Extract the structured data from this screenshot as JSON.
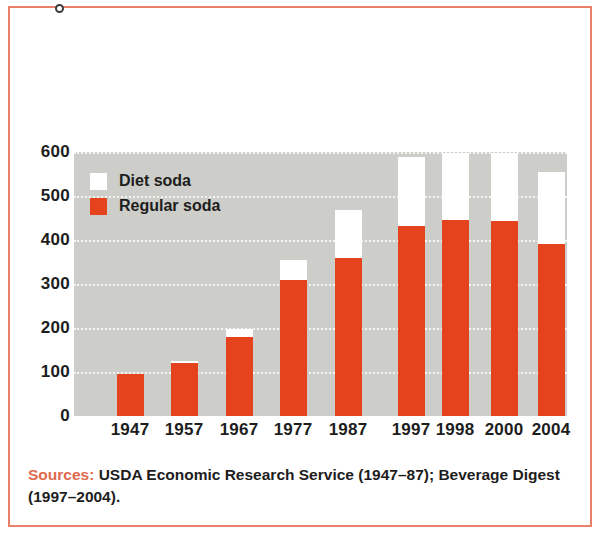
{
  "figure": {
    "frame_color": "#e8806a",
    "plot_background": "#cdcec9"
  },
  "legend": {
    "position": "inside-top-left",
    "items": [
      {
        "label": "Diet soda",
        "color": "#ffffff",
        "swatch_name": "diet-soda-swatch"
      },
      {
        "label": "Regular soda",
        "color": "#e5431d",
        "swatch_name": "regular-soda-swatch"
      }
    ]
  },
  "source": {
    "label": "Sources:",
    "text": " USDA Economic Research Service (1947–87); Beverage Digest (1997–2004).",
    "label_color": "#e06a4e"
  },
  "chart_data": {
    "type": "bar",
    "subtype": "stacked",
    "title": "",
    "xlabel": "",
    "ylabel": "",
    "ylim": [
      0,
      600
    ],
    "yticks": [
      0,
      100,
      200,
      300,
      400,
      500,
      600
    ],
    "ytick_labels": [
      "0",
      "100",
      "200",
      "300",
      "400",
      "500",
      "600"
    ],
    "grid": true,
    "grid_style": "dotted-white-horizontal",
    "categories": [
      "1947",
      "1957",
      "1967",
      "1977",
      "1987",
      "1997",
      "1998",
      "2000",
      "2004"
    ],
    "series": [
      {
        "name": "Regular soda",
        "color": "#e5431d",
        "values": [
          95,
          120,
          180,
          310,
          360,
          432,
          445,
          443,
          390
        ]
      },
      {
        "name": "Diet soda",
        "color": "#ffffff",
        "values": [
          0,
          4,
          18,
          45,
          108,
          156,
          153,
          155,
          165
        ]
      }
    ],
    "totals": [
      95,
      124,
      198,
      355,
      468,
      588,
      598,
      598,
      555
    ]
  }
}
